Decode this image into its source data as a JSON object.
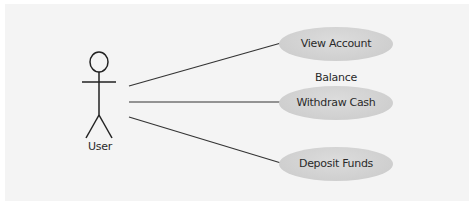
{
  "diagram": {
    "type": "use-case",
    "actor": {
      "label": "User"
    },
    "use_cases": [
      {
        "label": "View Account Balance"
      },
      {
        "label": "Withdraw Cash"
      },
      {
        "label": "Deposit Funds"
      }
    ],
    "colors": {
      "background": "#f4f4f4",
      "use_case_fill": "#d0d0d0",
      "line": "#333333"
    }
  }
}
